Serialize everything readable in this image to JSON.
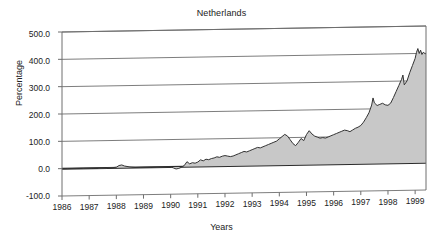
{
  "chart_data": {
    "type": "area",
    "title": "Netherlands",
    "xlabel": "Years",
    "ylabel": "Percentage",
    "ylim": [
      -100.0,
      500.0
    ],
    "ytick_labels": [
      "500.0",
      "400.0",
      "300.0",
      "200.0",
      "100.0",
      "0.0",
      "-100.0"
    ],
    "ytick_values": [
      500,
      400,
      300,
      200,
      100,
      0,
      -100
    ],
    "xlim": [
      1986,
      1999.4
    ],
    "xtick_labels": [
      "1986",
      "1987",
      "1988",
      "1989",
      "1990",
      "1991",
      "1992",
      "1993",
      "1994",
      "1995",
      "1996",
      "1997",
      "1998",
      "1999"
    ],
    "xtick_values": [
      1986,
      1987,
      1988,
      1989,
      1990,
      1991,
      1992,
      1993,
      1994,
      1995,
      1996,
      1997,
      1998,
      1999
    ],
    "grid": true,
    "gridlines_at": [
      500,
      400,
      300,
      200,
      100,
      0
    ],
    "legend": "none",
    "fill_color": "#c8c8c8",
    "line_color": "#333333",
    "baseline_value": 0,
    "series": [
      {
        "name": "Netherlands index",
        "x": [
          1986.0,
          1986.2,
          1986.4,
          1986.6,
          1986.8,
          1987.0,
          1987.2,
          1987.4,
          1987.6,
          1987.8,
          1988.0,
          1988.1,
          1988.2,
          1988.3,
          1988.5,
          1988.7,
          1988.9,
          1989.1,
          1989.3,
          1989.5,
          1989.7,
          1989.9,
          1990.0,
          1990.1,
          1990.2,
          1990.3,
          1990.4,
          1990.5,
          1990.6,
          1990.7,
          1990.8,
          1990.9,
          1991.0,
          1991.1,
          1991.2,
          1991.3,
          1991.4,
          1991.5,
          1991.6,
          1991.7,
          1991.8,
          1991.9,
          1992.0,
          1992.1,
          1992.2,
          1992.3,
          1992.4,
          1992.5,
          1992.6,
          1992.7,
          1992.8,
          1992.9,
          1993.0,
          1993.1,
          1993.2,
          1993.3,
          1993.4,
          1993.5,
          1993.6,
          1993.7,
          1993.8,
          1993.9,
          1994.0,
          1994.1,
          1994.2,
          1994.3,
          1994.4,
          1994.5,
          1994.6,
          1994.7,
          1994.8,
          1994.9,
          1995.0,
          1995.1,
          1995.2,
          1995.3,
          1995.4,
          1995.5,
          1995.6,
          1995.7,
          1995.8,
          1995.9,
          1996.0,
          1996.1,
          1996.2,
          1996.3,
          1996.4,
          1996.5,
          1996.6,
          1996.7,
          1996.8,
          1996.9,
          1997.0,
          1997.1,
          1997.2,
          1997.3,
          1997.4,
          1997.45,
          1997.5,
          1997.6,
          1997.7,
          1997.8,
          1997.9,
          1998.0,
          1998.1,
          1998.2,
          1998.3,
          1998.4,
          1998.5,
          1998.55,
          1998.6,
          1998.7,
          1998.8,
          1998.9,
          1999.0,
          1999.05,
          1999.1,
          1999.15,
          1999.2,
          1999.25,
          1999.3,
          1999.35,
          1999.4
        ],
        "y": [
          0,
          0,
          0,
          0,
          0,
          0,
          0,
          0,
          0,
          0,
          2,
          8,
          10,
          6,
          2,
          0,
          0,
          0,
          0,
          0,
          0,
          0,
          0,
          -4,
          -8,
          -6,
          -2,
          4,
          18,
          10,
          14,
          12,
          16,
          24,
          20,
          26,
          24,
          28,
          30,
          34,
          32,
          36,
          38,
          36,
          34,
          36,
          40,
          44,
          48,
          52,
          50,
          54,
          58,
          62,
          66,
          64,
          68,
          72,
          76,
          80,
          84,
          88,
          96,
          104,
          112,
          106,
          92,
          78,
          70,
          82,
          96,
          88,
          110,
          124,
          112,
          104,
          100,
          96,
          98,
          96,
          100,
          104,
          108,
          112,
          116,
          120,
          124,
          122,
          118,
          124,
          130,
          134,
          140,
          152,
          168,
          186,
          214,
          240,
          222,
          212,
          216,
          220,
          214,
          212,
          220,
          240,
          262,
          284,
          306,
          322,
          286,
          300,
          330,
          356,
          382,
          404,
          418,
          400,
          412,
          396,
          404,
          400,
          398
        ]
      }
    ]
  }
}
